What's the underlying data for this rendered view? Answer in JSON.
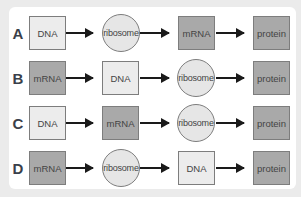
{
  "diagram": {
    "title": "",
    "rows": [
      {
        "letter": "A",
        "nodes": [
          {
            "label": "DNA",
            "shape": "box",
            "shade": "light"
          },
          {
            "label": "ribosome",
            "shape": "circle",
            "shade": "light"
          },
          {
            "label": "mRNA",
            "shape": "box",
            "shade": "dark"
          },
          {
            "label": "protein",
            "shape": "box",
            "shade": "dark"
          }
        ]
      },
      {
        "letter": "B",
        "nodes": [
          {
            "label": "mRNA",
            "shape": "box",
            "shade": "dark"
          },
          {
            "label": "DNA",
            "shape": "box",
            "shade": "light"
          },
          {
            "label": "ribosome",
            "shape": "circle",
            "shade": "light"
          },
          {
            "label": "protein",
            "shape": "box",
            "shade": "dark"
          }
        ]
      },
      {
        "letter": "C",
        "nodes": [
          {
            "label": "DNA",
            "shape": "box",
            "shade": "light"
          },
          {
            "label": "mRNA",
            "shape": "box",
            "shade": "dark"
          },
          {
            "label": "ribosome",
            "shape": "circle",
            "shade": "light"
          },
          {
            "label": "protein",
            "shape": "box",
            "shade": "dark"
          }
        ]
      },
      {
        "letter": "D",
        "nodes": [
          {
            "label": "mRNA",
            "shape": "box",
            "shade": "dark"
          },
          {
            "label": "ribosome",
            "shape": "circle",
            "shade": "light"
          },
          {
            "label": "DNA",
            "shape": "box",
            "shade": "light"
          },
          {
            "label": "protein",
            "shape": "box",
            "shade": "dark"
          }
        ]
      }
    ],
    "colors": {
      "light": "#ececec",
      "dark": "#a9a9a9",
      "arrow": "#1a1a1a",
      "border": "#7d7d7d"
    }
  }
}
